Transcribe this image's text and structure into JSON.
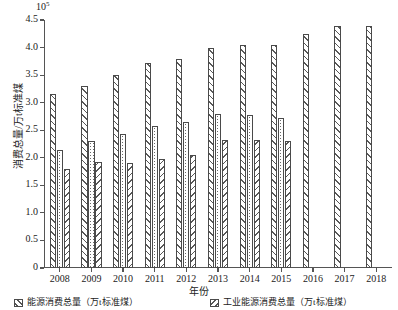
{
  "chart_data": {
    "type": "bar",
    "title": "",
    "subtitle": "",
    "xlabel": "年份",
    "ylabel": "消费总量/万t标准煤",
    "y_multiplier": "10",
    "y_multiplier_exp": "5",
    "ylim": [
      0,
      4.5
    ],
    "ytick_labels": [
      "0",
      "0.5",
      "1.0",
      "1.5",
      "2.0",
      "2.5",
      "3.0",
      "3.5",
      "4.0",
      "4.5"
    ],
    "ytick_values": [
      0,
      0.5,
      1.0,
      1.5,
      2.0,
      2.5,
      3.0,
      3.5,
      4.0,
      4.5
    ],
    "grid": false,
    "legend_position": "bottom",
    "categories": [
      "2008",
      "2009",
      "2010",
      "2011",
      "2012",
      "2013",
      "2014",
      "2015",
      "2016",
      "2017",
      "2018"
    ],
    "series": [
      {
        "name": "能源消费总量（万t标准煤）",
        "pattern": "diagonal-hatch-right",
        "values": [
          3.15,
          3.3,
          3.5,
          3.72,
          3.8,
          4.0,
          4.05,
          4.05,
          4.25,
          4.4,
          4.4
        ]
      },
      {
        "name": "series-2",
        "pattern": "dotted",
        "values": [
          2.15,
          2.3,
          2.43,
          2.57,
          2.65,
          2.8,
          2.78,
          2.72,
          null,
          null,
          null
        ]
      },
      {
        "name": "工业能源消费总量（万t标准煤）",
        "pattern": "diagonal-hatch-left",
        "values": [
          1.8,
          1.92,
          1.9,
          1.97,
          2.05,
          2.32,
          2.32,
          2.3,
          null,
          null,
          null
        ]
      }
    ],
    "legend_entries": [
      "能源消费总量（万t标准煤）",
      "工业能源消费总量（万t标准煤）"
    ]
  }
}
